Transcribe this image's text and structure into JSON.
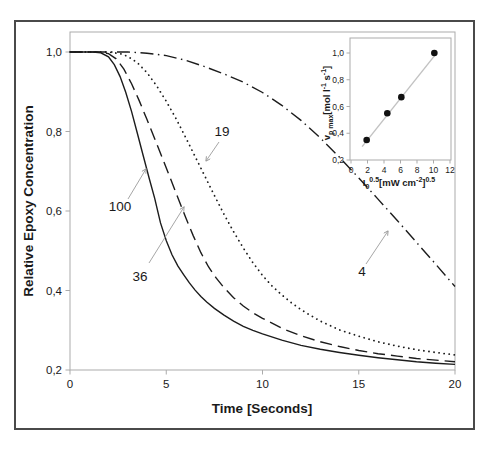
{
  "figure": {
    "title": "",
    "xlabel": "Time [Seconds]",
    "ylabel": "Relative Epoxy Concentration"
  },
  "chart_data": {
    "type": "line",
    "title": "",
    "xlabel": "Time [Seconds]",
    "ylabel": "Relative Epoxy Concentration",
    "xlim": [
      0,
      20
    ],
    "ylim": [
      0.2,
      1.0
    ],
    "grid": false,
    "legend": "none (curves labeled with arrows)",
    "decimal_separator": ",",
    "xticks": {
      "values": [
        0,
        5,
        10,
        15,
        20
      ],
      "labels": [
        "0",
        "5",
        "10",
        "15",
        "20"
      ]
    },
    "yticks": {
      "values": [
        1.0,
        0.8,
        0.6,
        0.4,
        0.2
      ],
      "labels": [
        "1,0",
        "0,8",
        "0,6",
        "0,4",
        "0,2"
      ]
    },
    "series": [
      {
        "name": "100",
        "line_style": "solid",
        "points": [
          [
            0,
            1.0
          ],
          [
            0.6,
            1.0
          ],
          [
            1.2,
            1.0
          ],
          [
            1.6,
            0.998
          ],
          [
            2.0,
            0.988
          ],
          [
            2.3,
            0.968
          ],
          [
            2.6,
            0.938
          ],
          [
            2.9,
            0.898
          ],
          [
            3.2,
            0.85
          ],
          [
            3.5,
            0.795
          ],
          [
            3.8,
            0.74
          ],
          [
            4.1,
            0.685
          ],
          [
            4.4,
            0.632
          ],
          [
            4.7,
            0.57
          ],
          [
            5.0,
            0.525
          ],
          [
            5.3,
            0.49
          ],
          [
            5.6,
            0.462
          ],
          [
            5.9,
            0.44
          ],
          [
            6.2,
            0.419
          ],
          [
            6.5,
            0.401
          ],
          [
            6.8,
            0.385
          ],
          [
            7.1,
            0.371
          ],
          [
            7.5,
            0.355
          ],
          [
            8.0,
            0.338
          ],
          [
            8.5,
            0.323
          ],
          [
            9.0,
            0.31
          ],
          [
            9.5,
            0.3
          ],
          [
            10.0,
            0.291
          ],
          [
            11.0,
            0.275
          ],
          [
            12.0,
            0.262
          ],
          [
            13.0,
            0.252
          ],
          [
            14.0,
            0.244
          ],
          [
            15.0,
            0.237
          ],
          [
            16.0,
            0.231
          ],
          [
            17.0,
            0.226
          ],
          [
            18.0,
            0.221
          ],
          [
            19.0,
            0.217
          ],
          [
            20.0,
            0.214
          ]
        ]
      },
      {
        "name": "36",
        "line_style": "dashed",
        "points": [
          [
            0,
            1.0
          ],
          [
            0.7,
            1.0
          ],
          [
            1.4,
            1.0
          ],
          [
            2.0,
            0.996
          ],
          [
            2.4,
            0.983
          ],
          [
            2.8,
            0.957
          ],
          [
            3.2,
            0.92
          ],
          [
            3.6,
            0.877
          ],
          [
            4.0,
            0.83
          ],
          [
            4.4,
            0.782
          ],
          [
            4.8,
            0.733
          ],
          [
            5.2,
            0.684
          ],
          [
            5.6,
            0.634
          ],
          [
            6.0,
            0.585
          ],
          [
            6.4,
            0.538
          ],
          [
            6.8,
            0.495
          ],
          [
            7.2,
            0.459
          ],
          [
            7.6,
            0.431
          ],
          [
            8.0,
            0.407
          ],
          [
            8.5,
            0.382
          ],
          [
            9.0,
            0.361
          ],
          [
            9.5,
            0.344
          ],
          [
            10.0,
            0.33
          ],
          [
            11.0,
            0.305
          ],
          [
            12.0,
            0.286
          ],
          [
            13.0,
            0.271
          ],
          [
            14.0,
            0.259
          ],
          [
            15.0,
            0.249
          ],
          [
            16.0,
            0.241
          ],
          [
            17.0,
            0.235
          ],
          [
            18.0,
            0.229
          ],
          [
            19.0,
            0.225
          ],
          [
            20.0,
            0.221
          ]
        ]
      },
      {
        "name": "19",
        "line_style": "dotted",
        "points": [
          [
            0,
            1.0
          ],
          [
            1.0,
            1.0
          ],
          [
            2.0,
            1.0
          ],
          [
            2.6,
            0.996
          ],
          [
            3.0,
            0.989
          ],
          [
            3.5,
            0.973
          ],
          [
            4.0,
            0.948
          ],
          [
            4.5,
            0.915
          ],
          [
            5.0,
            0.876
          ],
          [
            5.5,
            0.833
          ],
          [
            6.0,
            0.786
          ],
          [
            6.5,
            0.737
          ],
          [
            7.0,
            0.688
          ],
          [
            7.5,
            0.639
          ],
          [
            8.0,
            0.592
          ],
          [
            8.5,
            0.548
          ],
          [
            9.0,
            0.507
          ],
          [
            9.5,
            0.47
          ],
          [
            10.0,
            0.438
          ],
          [
            10.5,
            0.411
          ],
          [
            11.0,
            0.389
          ],
          [
            11.5,
            0.369
          ],
          [
            12.0,
            0.352
          ],
          [
            12.5,
            0.337
          ],
          [
            13.0,
            0.323
          ],
          [
            14.0,
            0.301
          ],
          [
            15.0,
            0.285
          ],
          [
            16.0,
            0.271
          ],
          [
            17.0,
            0.26
          ],
          [
            18.0,
            0.251
          ],
          [
            19.0,
            0.244
          ],
          [
            20.0,
            0.238
          ]
        ]
      },
      {
        "name": "4",
        "line_style": "dashdot",
        "points": [
          [
            0,
            1.0
          ],
          [
            1.0,
            1.0
          ],
          [
            2.0,
            1.0
          ],
          [
            3.0,
            1.0
          ],
          [
            4.0,
            0.997
          ],
          [
            5.0,
            0.991
          ],
          [
            6.0,
            0.979
          ],
          [
            7.0,
            0.963
          ],
          [
            8.0,
            0.945
          ],
          [
            9.0,
            0.924
          ],
          [
            10.0,
            0.898
          ],
          [
            11.0,
            0.866
          ],
          [
            12.0,
            0.828
          ],
          [
            13.0,
            0.784
          ],
          [
            14.0,
            0.735
          ],
          [
            15.0,
            0.683
          ],
          [
            16.0,
            0.63
          ],
          [
            17.0,
            0.576
          ],
          [
            18.0,
            0.521
          ],
          [
            19.0,
            0.466
          ],
          [
            20.0,
            0.41
          ]
        ]
      }
    ],
    "annotations": [
      {
        "text": "100",
        "label_px": [
          120,
          211
        ],
        "arrow_px": [
          [
            128,
            199
          ],
          [
            146,
            169
          ]
        ]
      },
      {
        "text": "36",
        "label_px": [
          140,
          281
        ],
        "arrow_px": [
          [
            149,
            263
          ],
          [
            184,
            207
          ]
        ]
      },
      {
        "text": "19",
        "label_px": [
          222,
          136
        ],
        "arrow_px": [
          [
            219,
            142
          ],
          [
            206,
            161
          ]
        ]
      },
      {
        "text": "4",
        "label_px": [
          362,
          276
        ],
        "arrow_px": [
          [
            366,
            264
          ],
          [
            388,
            231
          ]
        ]
      }
    ],
    "inset": {
      "type": "scatter",
      "position": "upper right",
      "xlabel_plain": "I0^0.5 [mW cm^-2]^0.5",
      "ylabel_plain": "vp max [mol l^-1 s^-1]",
      "xlabel_parts": [
        {
          "t": "I",
          "s": "n"
        },
        {
          "t": "0",
          "s": "sub"
        },
        {
          "t": "0.5",
          "s": "sup"
        },
        {
          "t": "[mW cm",
          "s": "n"
        },
        {
          "t": "-2",
          "s": "sup"
        },
        {
          "t": "]",
          "s": "n"
        },
        {
          "t": "0.5",
          "s": "sup"
        }
      ],
      "ylabel_parts": [
        {
          "t": "v",
          "s": "n"
        },
        {
          "t": "p max",
          "s": "sub"
        },
        {
          "t": "[mol l",
          "s": "n"
        },
        {
          "t": "-1",
          "s": "sup"
        },
        {
          "t": " s",
          "s": "n"
        },
        {
          "t": "-1",
          "s": "sup"
        },
        {
          "t": "]",
          "s": "n"
        }
      ],
      "xlim": [
        0,
        12
      ],
      "ylim": [
        0.2,
        1.0
      ],
      "xticks": {
        "values": [
          0,
          2,
          4,
          6,
          8,
          10,
          12
        ],
        "labels": [
          "0",
          "2",
          "4",
          "6",
          "8",
          "10",
          "12"
        ]
      },
      "yticks": {
        "values": [
          1.0,
          0.8,
          0.6,
          0.4,
          0.2
        ],
        "labels": [
          "1,0",
          "0,8",
          "0,6",
          "0,4",
          "0,2"
        ]
      },
      "points": [
        [
          1.9,
          0.35
        ],
        [
          4.4,
          0.55
        ],
        [
          6.1,
          0.67
        ],
        [
          10.1,
          1.0
        ]
      ],
      "fit_line": {
        "x1": 1.35,
        "y1": 0.3,
        "x2": 10.45,
        "y2": 1.005
      }
    },
    "colors": {
      "curve": "#1c1c1c",
      "axis": "#ababab",
      "arrow": "#9c9c9c",
      "text": "#1a1a1a",
      "frame": "#4a4a4a",
      "fit_line": "#c2c2c2",
      "marker": "#111111",
      "background": "#ffffff"
    }
  }
}
